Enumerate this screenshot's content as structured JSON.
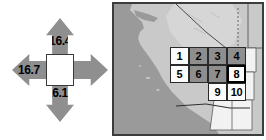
{
  "nav_compass": {
    "name": "page-navigation-compass",
    "center": {
      "label": ""
    },
    "arrows": [
      {
        "direction": "up",
        "label": "16.4",
        "has_label": true
      },
      {
        "direction": "left",
        "label": "16.7",
        "has_label": true
      },
      {
        "direction": "down",
        "label": "16.10",
        "has_label": true
      },
      {
        "direction": "right",
        "label": "",
        "has_label": false
      }
    ]
  },
  "map": {
    "name": "regional-index-map",
    "ocean_color": "#9a9a9a",
    "land_color": "#c9c9c9",
    "inset_color": "#f2f2f2",
    "border_color": "#3c3c3c",
    "boundary_line_color": "#4a4a4a"
  },
  "index_grid": {
    "selected_cell": "8",
    "cells": [
      {
        "label": "1",
        "row": 1,
        "col": 1,
        "fill": "white",
        "selected": false
      },
      {
        "label": "2",
        "row": 1,
        "col": 2,
        "fill": "gray",
        "selected": false
      },
      {
        "label": "3",
        "row": 1,
        "col": 3,
        "fill": "gray",
        "selected": false
      },
      {
        "label": "4",
        "row": 1,
        "col": 4,
        "fill": "gray",
        "selected": false
      },
      {
        "label": "5",
        "row": 2,
        "col": 1,
        "fill": "white",
        "selected": false
      },
      {
        "label": "6",
        "row": 2,
        "col": 2,
        "fill": "gray",
        "selected": false
      },
      {
        "label": "7",
        "row": 2,
        "col": 3,
        "fill": "gray",
        "selected": false
      },
      {
        "label": "8",
        "row": 2,
        "col": 4,
        "fill": "white",
        "selected": true
      },
      {
        "label": "9",
        "row": 3,
        "col": 3,
        "fill": "white",
        "selected": false
      },
      {
        "label": "10",
        "row": 3,
        "col": 4,
        "fill": "white",
        "selected": false
      }
    ]
  }
}
